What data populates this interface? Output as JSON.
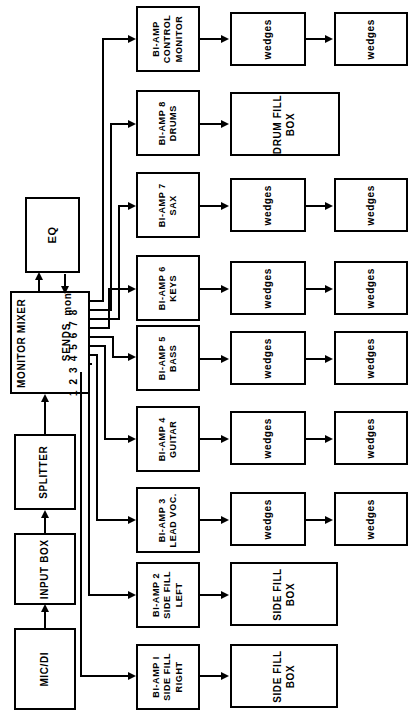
{
  "diagram": {
    "orientation": "text-rotated-90-ccw",
    "line_color": "#000000",
    "background_color": "#ffffff"
  },
  "input_chain": {
    "mic_di": "MIC/DI",
    "input_box": "INPUT BOX",
    "splitter": "SPLITTER",
    "monitor_mixer": "MONITOR MIXER",
    "eq": "EQ"
  },
  "mixer": {
    "name": "MONITOR MIXER",
    "sends_label": "SENDS",
    "send_numbers": [
      "1",
      "2",
      "3",
      "4",
      "5",
      "6",
      "7",
      "8"
    ],
    "send_numbers_text": "1 2 3 4 5 6 7 8",
    "mon_label": "mon"
  },
  "rows": [
    {
      "amp": {
        "line1": "BI-AMP",
        "line2": "CONTROL",
        "line3": "MONITOR"
      },
      "speakers": [
        {
          "label": "wedges"
        },
        {
          "label": "wedges"
        }
      ],
      "wide_box": null,
      "send": "mon"
    },
    {
      "amp": {
        "line1": "BI-AMP 8",
        "line2": "DRUMS",
        "line3": ""
      },
      "speakers": [],
      "wide_box": {
        "line1": "DRUM FILL",
        "line2": "BOX"
      },
      "send": "8"
    },
    {
      "amp": {
        "line1": "BI-AMP 7",
        "line2": "SAX",
        "line3": ""
      },
      "speakers": [
        {
          "label": "wedges"
        },
        {
          "label": "wedges"
        }
      ],
      "wide_box": null,
      "send": "7"
    },
    {
      "amp": {
        "line1": "BI-AMP 6",
        "line2": "KEYS",
        "line3": ""
      },
      "speakers": [
        {
          "label": "wedges"
        },
        {
          "label": "wedges"
        }
      ],
      "wide_box": null,
      "send": "6"
    },
    {
      "amp": {
        "line1": "BI-AMP 5",
        "line2": "BASS",
        "line3": ""
      },
      "speakers": [
        {
          "label": "wedges"
        },
        {
          "label": "wedges"
        }
      ],
      "wide_box": null,
      "send": "5"
    },
    {
      "amp": {
        "line1": "BI-AMP 4",
        "line2": "GUITAR",
        "line3": ""
      },
      "speakers": [
        {
          "label": "wedges"
        },
        {
          "label": "wedges"
        }
      ],
      "wide_box": null,
      "send": "4"
    },
    {
      "amp": {
        "line1": "BI-AMP 3",
        "line2": "LEAD VOC.",
        "line3": ""
      },
      "speakers": [
        {
          "label": "wedges"
        },
        {
          "label": "wedges"
        }
      ],
      "wide_box": null,
      "send": "3"
    },
    {
      "amp": {
        "line1": "BI-AMP 2",
        "line2": "SIDE FILL",
        "line3": "LEFT"
      },
      "speakers": [],
      "wide_box": {
        "line1": "SIDE FILL",
        "line2": "BOX"
      },
      "send": "2"
    },
    {
      "amp": {
        "line1": "BI-AMP I",
        "line2": "SIDE FILL",
        "line3": "RIGHT"
      },
      "speakers": [],
      "wide_box": {
        "line1": "SIDE FILL",
        "line2": "BOX"
      },
      "send": "1"
    }
  ]
}
